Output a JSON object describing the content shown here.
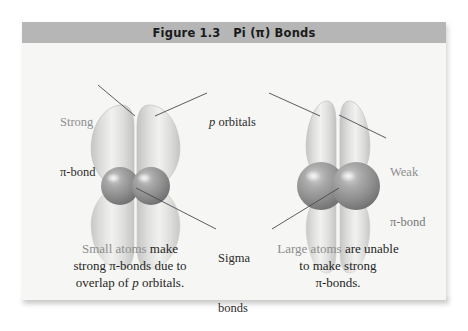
{
  "figure": {
    "title": "Figure 1.3   Pi (π) Bonds",
    "title_number": "Figure 1.3",
    "title_subject": "Pi (π) Bonds"
  },
  "colors": {
    "banner_gray": "#b6b6b6",
    "panel_background": "#f7f7f5",
    "page_background": "#ffffff",
    "sphere_gray": "#8e8e8e",
    "sphere_highlight": "#d6d6d6",
    "orbital_lobe_light": "#e8e8e6",
    "orbital_lobe_edge": "#c9c9c7",
    "leader_line": "#4a4a52",
    "label_gray": "#8e8e8e",
    "label_dark": "#2b2b2b",
    "caption_text": "#1f1f1f",
    "caption_highlight": "#8d8d8d"
  },
  "labels": {
    "strong_pi": {
      "line1": "Strong",
      "line2": "π-bond"
    },
    "p_orbitals": {
      "italic_part": "p",
      "rest": " orbitals"
    },
    "weak_pi": {
      "line1": "Weak",
      "line2": "π-bond"
    },
    "sigma": {
      "line1": "Sigma",
      "line2": "bonds"
    }
  },
  "captions": {
    "left": {
      "highlight": "Small atoms",
      "line1_rest": " make",
      "line2": "strong π-bonds due to",
      "line3_pre": "overlap of ",
      "line3_italic": "p",
      "line3_post": " orbitals."
    },
    "right": {
      "highlight": "Large atoms",
      "line1_rest": " are unable",
      "line2": "to make strong",
      "line3": "π-bonds."
    }
  },
  "diagram": {
    "left_structure": {
      "name": "small-atoms-pi-bond",
      "description": "Two small atoms with strongly overlapping p orbitals",
      "atom_radius": 18,
      "lobe_width": 34,
      "lobe_overlap": "large"
    },
    "right_structure": {
      "name": "large-atoms-pi-bond",
      "description": "Two large atoms with poorly overlapping p orbitals",
      "atom_radius": 23,
      "lobe_width": 26,
      "lobe_overlap": "small"
    }
  }
}
